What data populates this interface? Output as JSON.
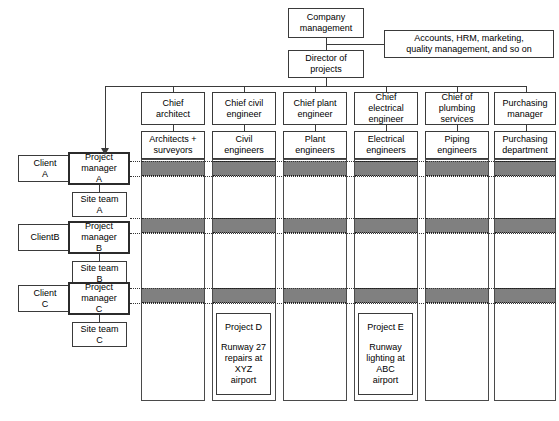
{
  "diagram": {
    "colors": {
      "band_fill": "#808080",
      "box_border": "#3a3a3a",
      "background": "#ffffff"
    },
    "top": {
      "company_management": "Company\nmanagement",
      "director_of_projects": "Director of\nprojects",
      "support_functions": "Accounts, HRM, marketing,\nquality management, and so on"
    },
    "departments": [
      {
        "chief": "Chief\narchitect",
        "staff": "Architects +\nsurveyors"
      },
      {
        "chief": "Chief civil\nengineer",
        "staff": "Civil\nengineers"
      },
      {
        "chief": "Chief plant\nengineer",
        "staff": "Plant\nengineers"
      },
      {
        "chief": "Chief\nelectrical\nengineer",
        "staff": "Electrical\nengineers"
      },
      {
        "chief": "Chief of\nplumbing\nservices",
        "staff": "Piping\nengineers"
      },
      {
        "chief": "Purchasing\nmanager",
        "staff": "Purchasing\ndepartment"
      }
    ],
    "projects_left": [
      {
        "client": "Client\nA",
        "manager": "Project\nmanager\nA",
        "site_team": "Site team\nA"
      },
      {
        "client": "ClientB",
        "manager": "Project\nmanager\nB",
        "site_team": "Site team\nB"
      },
      {
        "client": "Client\nC",
        "manager": "Project\nmanager\nC",
        "site_team": "Site team\nC"
      }
    ],
    "project_cards": [
      {
        "title": "Project D",
        "description": "Runway 27\nrepairs at\nXYZ\nairport",
        "column": 2
      },
      {
        "title": "Project E",
        "description": "Runway\nlighting at\nABC\nairport",
        "column": 4
      }
    ]
  }
}
